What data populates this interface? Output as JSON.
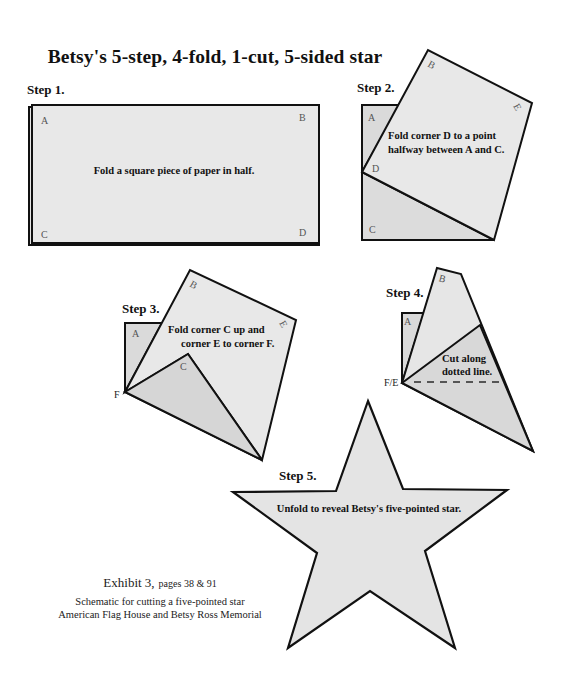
{
  "title": "Betsy's 5-step, 4-fold, 1-cut, 5-sided star",
  "colors": {
    "paper_fill": "#e6e6e6",
    "paper_fill_dark": "#d8d8d8",
    "stroke": "#111111",
    "background": "#ffffff"
  },
  "steps": [
    {
      "label": "Step 1.",
      "instruction": "Fold a square piece of paper in half.",
      "corners": [
        "A",
        "B",
        "C",
        "D"
      ]
    },
    {
      "label": "Step 2.",
      "instruction_lines": [
        "Fold corner D to a point",
        "halfway between A and C."
      ],
      "corners": [
        "A",
        "B",
        "E",
        "D",
        "C"
      ]
    },
    {
      "label": "Step 3.",
      "instruction_lines": [
        "Fold corner C up and",
        "corner E to corner F."
      ],
      "corners": [
        "A",
        "B",
        "E",
        "C",
        "F"
      ]
    },
    {
      "label": "Step 4.",
      "instruction_lines": [
        "Cut along",
        "dotted line."
      ],
      "corners": [
        "A",
        "B",
        "F/E"
      ]
    },
    {
      "label": "Step 5.",
      "instruction": "Unfold to reveal Betsy's five-pointed star."
    }
  ],
  "caption": {
    "exhibit": "Exhibit 3,",
    "pages": "pages 38 & 91",
    "line1": "Schematic for cutting a five-pointed star",
    "line2": "American  Flag House and Betsy Ross Memorial"
  }
}
